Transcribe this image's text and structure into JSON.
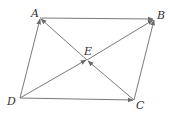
{
  "diagram": {
    "points": {
      "A": {
        "label": "A",
        "x": 40,
        "y": 18
      },
      "B": {
        "label": "B",
        "x": 154,
        "y": 19
      },
      "C": {
        "label": "C",
        "x": 134,
        "y": 100
      },
      "D": {
        "label": "D",
        "x": 20,
        "y": 98
      },
      "E": {
        "label": "E",
        "x": 87,
        "y": 60
      }
    },
    "vectors": [
      {
        "from": "A",
        "to": "B"
      },
      {
        "from": "D",
        "to": "A"
      },
      {
        "from": "C",
        "to": "B"
      },
      {
        "from": "D",
        "to": "C"
      },
      {
        "from": "D",
        "to": "E"
      },
      {
        "from": "E",
        "to": "B"
      },
      {
        "from": "C",
        "to": "E"
      },
      {
        "from": "E",
        "to": "A"
      }
    ],
    "line_color": "#7a7a7a",
    "label_color": "#333333"
  }
}
